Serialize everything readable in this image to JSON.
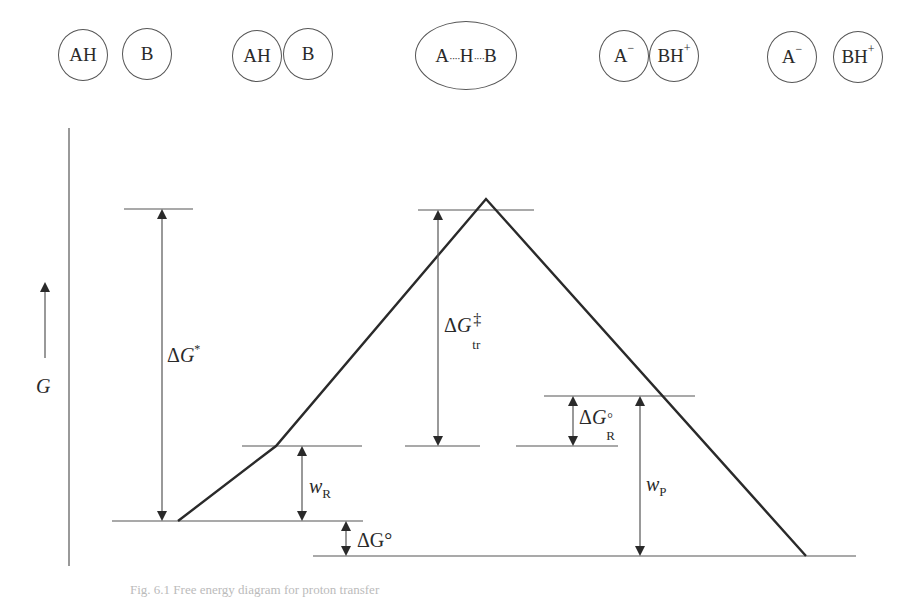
{
  "states": [
    {
      "id": "separated-reactants",
      "parts": [
        {
          "label": "AH",
          "charge": ""
        },
        {
          "label": "B",
          "charge": ""
        }
      ]
    },
    {
      "id": "reactant-complex",
      "parts": [
        {
          "label": "AH",
          "charge": ""
        },
        {
          "label": "B",
          "charge": ""
        }
      ]
    },
    {
      "id": "transition-state",
      "label_a": "A",
      "label_h": "H",
      "label_b": "B",
      "dots": "····"
    },
    {
      "id": "product-complex",
      "parts": [
        {
          "label": "A",
          "charge": "−"
        },
        {
          "label": "BH",
          "charge": "+"
        }
      ]
    },
    {
      "id": "separated-products",
      "parts": [
        {
          "label": "A",
          "charge": "−"
        },
        {
          "label": "BH",
          "charge": "+"
        }
      ]
    }
  ],
  "axis": {
    "label": "G"
  },
  "labels": {
    "delta_g_star": {
      "symbol": "Δ",
      "var": "G",
      "sup": "*"
    },
    "delta_g_tr": {
      "symbol": "Δ",
      "var": "G",
      "sub": "tr",
      "sup": "‡"
    },
    "delta_g_r0": {
      "symbol": "Δ",
      "var": "G",
      "sub": "R",
      "sup": "°"
    },
    "w_r": {
      "var": "w",
      "sub": "R"
    },
    "w_p": {
      "var": "w",
      "sub": "P"
    },
    "delta_g0": {
      "text": "ΔG°"
    }
  },
  "caption": {
    "text": "Fig. 6.1   Free energy diagram for proton transfer"
  },
  "colors": {
    "line": "#2a2a2a",
    "thin": "#555555"
  }
}
